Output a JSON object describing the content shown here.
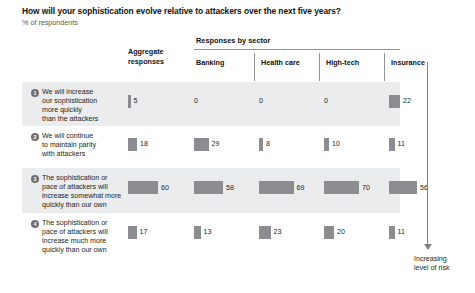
{
  "header": {
    "title": "How will your sophistication evolve relative to attackers over the next five years?",
    "subtitle": "% of respondents",
    "aggregate_head_line1": "Aggregate",
    "aggregate_head_line2": "responses",
    "sector_group_label": "Responses by sector"
  },
  "annotation": {
    "arrow_icon": "down-arrow-icon",
    "label_line1": "Increasing",
    "label_line2": "level of risk"
  },
  "colors": {
    "bar": "#8c8d90",
    "row_shade": "#ebecee",
    "badge": "#6d6e71",
    "rule": "#939598",
    "text": "#231f20"
  },
  "chart_data": {
    "type": "bar",
    "title": "How will your sophistication evolve relative to attackers over the next five years?",
    "subtitle": "% of respondents",
    "xlabel": "",
    "ylabel": "% of respondents",
    "xlim": [
      0,
      100
    ],
    "grid": false,
    "legend": "none",
    "orientation": "horizontal",
    "value_unit": "%",
    "categories": [
      "Aggregate responses",
      "Banking",
      "Health care",
      "High-tech",
      "Insurance"
    ],
    "series": [
      {
        "number": "1",
        "name": "We will increase our sophistication more quickly than the attackers",
        "label_lines": [
          "We will increase",
          "our sophistication",
          "more quickly",
          "than the attackers"
        ],
        "values": [
          5,
          0,
          0,
          0,
          22
        ]
      },
      {
        "number": "2",
        "name": "We will continue to maintain parity with attackers",
        "label_lines": [
          "We will continue",
          "to maintain parity",
          "with attackers"
        ],
        "values": [
          18,
          29,
          8,
          10,
          11
        ]
      },
      {
        "number": "3",
        "name": "The sophistication or pace of attackers will increase somewhat more quickly than our own",
        "label_lines": [
          "The sophistication or",
          "pace of attackers will",
          "increase somewhat more",
          "quickly than our own"
        ],
        "values": [
          60,
          58,
          69,
          70,
          56
        ]
      },
      {
        "number": "4",
        "name": "The sophistication or pace of attackers will increase much more quickly than our own",
        "label_lines": [
          "The sophistication or",
          "pace of attackers will",
          "increase much more",
          "quickly than our own"
        ],
        "values": [
          17,
          13,
          23,
          20,
          11
        ]
      }
    ],
    "annotations": [
      "Increasing level of risk"
    ]
  }
}
